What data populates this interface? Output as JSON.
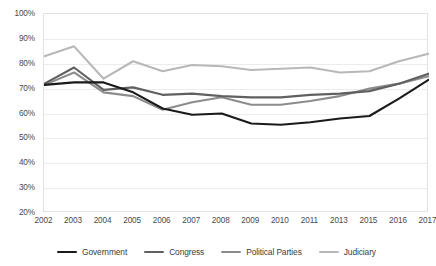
{
  "chart_data": {
    "type": "line",
    "title": "",
    "subtitle": "",
    "xlabel": "",
    "ylabel": "",
    "grid": true,
    "legend_position": "bottom",
    "categories": [
      "2002",
      "2003",
      "2004",
      "2005",
      "2006",
      "2007",
      "2008",
      "2009",
      "2010",
      "2011",
      "2013",
      "2015",
      "2016",
      "2017"
    ],
    "ylim": [
      20,
      100
    ],
    "ytick_labels": [
      "100%",
      "90%",
      "80%",
      "70%",
      "60%",
      "50%",
      "40%",
      "30%",
      "20%"
    ],
    "ytick_values": [
      100,
      90,
      80,
      70,
      60,
      50,
      40,
      30,
      20
    ],
    "series": [
      {
        "name": "Government",
        "color": "#1a1a1a",
        "values": [
          71.5,
          72.5,
          72.5,
          68.5,
          62.0,
          59.5,
          60.0,
          56.0,
          55.5,
          56.5,
          58.0,
          59.0,
          66.0,
          73.5
        ]
      },
      {
        "name": "Congress",
        "color": "#606060",
        "values": [
          72.0,
          78.5,
          69.5,
          70.5,
          67.5,
          68.0,
          67.0,
          66.5,
          66.5,
          67.5,
          68.0,
          69.0,
          72.0,
          76.0
        ]
      },
      {
        "name": "Political Parties",
        "color": "#8c8c8c",
        "values": [
          71.5,
          76.5,
          68.5,
          67.0,
          61.5,
          64.5,
          66.5,
          63.5,
          63.5,
          65.0,
          67.0,
          70.0,
          72.0,
          75.0
        ]
      },
      {
        "name": "Judiciary",
        "color": "#b8b8b8",
        "values": [
          83.0,
          87.0,
          74.0,
          81.0,
          77.0,
          79.5,
          79.0,
          77.5,
          78.0,
          78.5,
          76.5,
          77.0,
          81.0,
          84.0
        ]
      }
    ]
  },
  "legend": {
    "items": [
      {
        "label": "Government",
        "color": "#1a1a1a"
      },
      {
        "label": "Congress",
        "color": "#606060"
      },
      {
        "label": "Political Parties",
        "color": "#8c8c8c"
      },
      {
        "label": "Judiciary",
        "color": "#b8b8b8"
      }
    ]
  }
}
